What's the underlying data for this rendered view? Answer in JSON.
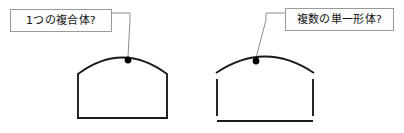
{
  "diagram": {
    "background_color": "#ffffff",
    "stroke_color": "#1b1b1b",
    "leader_color": "#8d8d8d",
    "callout_border_color": "#9a9a9a",
    "callout_fill_color": "#fdfdfd",
    "dot_color": "#000000"
  },
  "callouts": [
    {
      "id": "left",
      "label": "1つの複合体?",
      "points_to": "left-shape-outline"
    },
    {
      "id": "right",
      "label": "複数の単一形体?",
      "points_to": "right-shape-segments"
    }
  ],
  "shapes": {
    "left": {
      "name": "arched-shape-continuous",
      "description": "closed continuous arch outline",
      "segment_count": 1,
      "path": "M 78 118 L 78 74 Q 122.5 41 167 74 L 167 118 Z",
      "dot": {
        "cx": 128,
        "cy": 60,
        "r": 3.4
      },
      "leader": "M 112 13 L 130 13 L 130 20 L 128 57"
    },
    "right": {
      "name": "arched-shape-segmented",
      "description": "four disconnected line segments forming an arch outline",
      "segment_count": 4,
      "segments": [
        {
          "name": "top-arc",
          "path": "M 216 73 Q 265 40 314 73"
        },
        {
          "name": "left-vertical",
          "path": "M 217 79 L 217 116"
        },
        {
          "name": "right-vertical",
          "path": "M 313 79 L 313 116"
        },
        {
          "name": "bottom-horizontal",
          "path": "M 217 121 L 313 121"
        }
      ],
      "dot": {
        "cx": 256,
        "cy": 61,
        "r": 3.4
      },
      "leader": "M 285 13 L 266 13 L 266 20 L 256 58"
    }
  }
}
